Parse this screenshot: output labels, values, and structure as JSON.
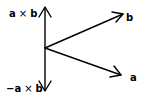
{
  "diagram": {
    "type": "vector-cross-product",
    "origin": {
      "x": 45,
      "y": 48
    },
    "vectors": [
      {
        "name": "a_cross_b",
        "label_left": "a",
        "label_op": "×",
        "label_right": "b",
        "tip": {
          "x": 45,
          "y": 7
        }
      },
      {
        "name": "neg_a_cross_b",
        "label_left": "−a",
        "label_op": "×",
        "label_right": "b",
        "tip": {
          "x": 45,
          "y": 91
        }
      },
      {
        "name": "b",
        "label": "b",
        "tip": {
          "x": 123,
          "y": 14
        }
      },
      {
        "name": "a",
        "label": "a",
        "tip": {
          "x": 121,
          "y": 75
        }
      }
    ],
    "colors": {
      "stroke": "#000000",
      "background": "#ffffff"
    }
  }
}
